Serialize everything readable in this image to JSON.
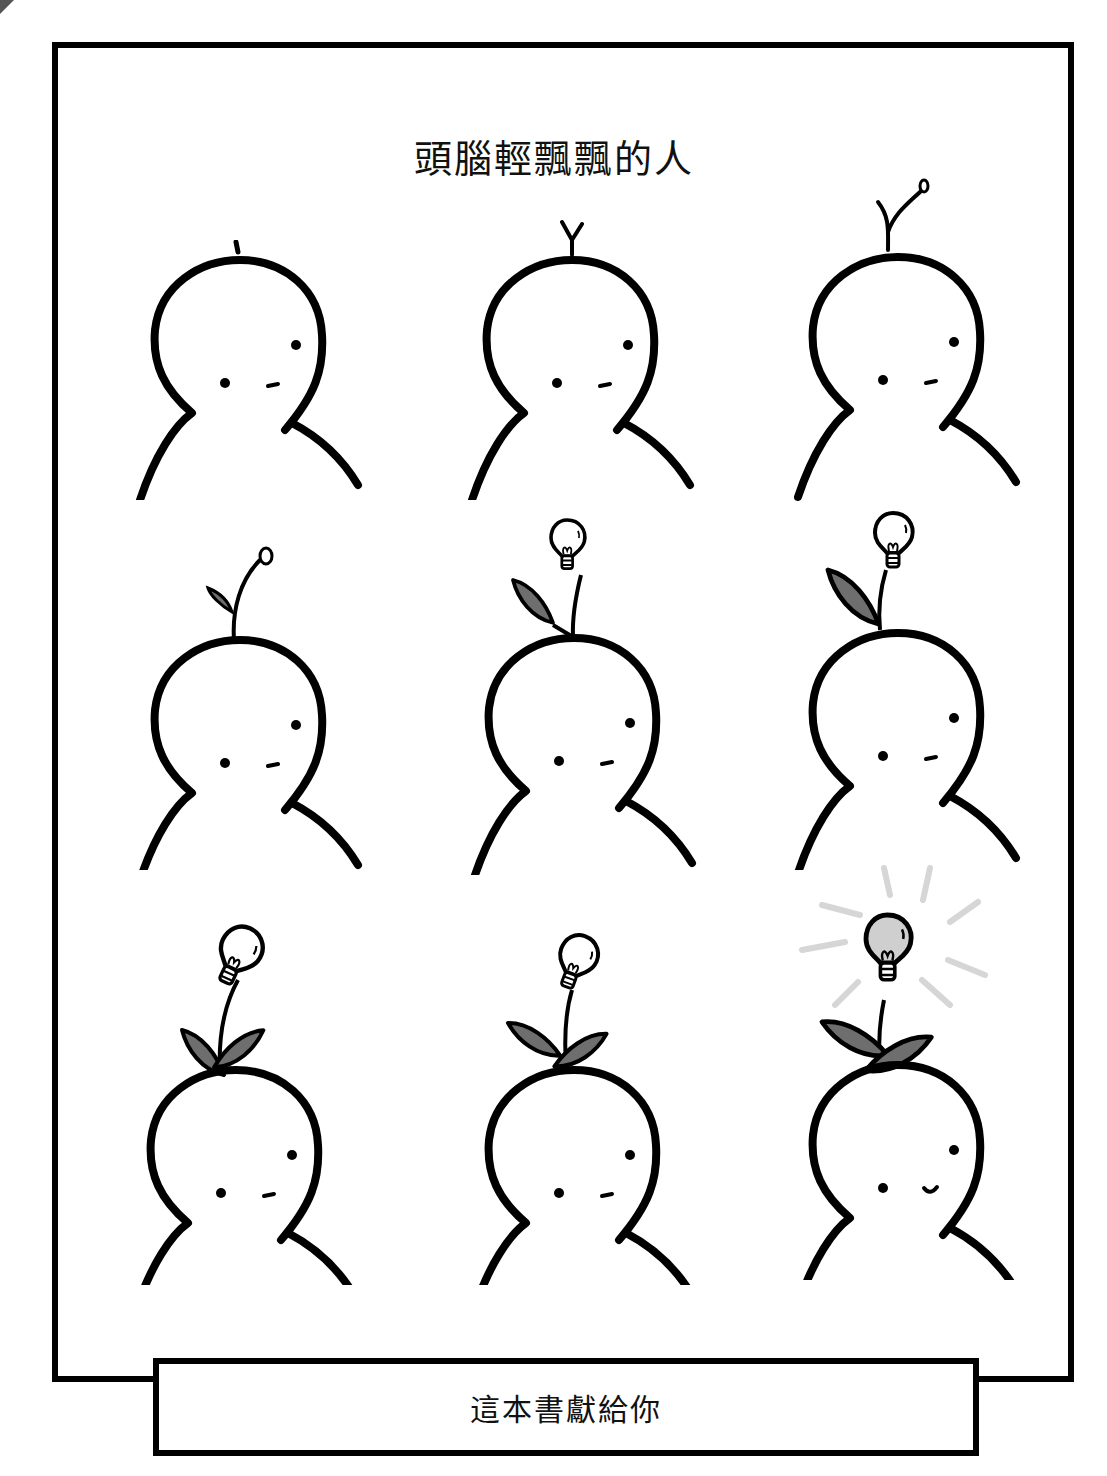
{
  "page": {
    "title": "頭腦輕飄飄的人",
    "dedication": "這本書獻給你"
  },
  "colors": {
    "ink": "#000000",
    "leaf_fill": "#6e6e6e",
    "bulb_lit_fill": "#cfcfcf",
    "rays": "#d6d6d6",
    "background": "#ffffff"
  },
  "figures": [
    {
      "row": 1,
      "col": 1,
      "stage": "nub",
      "expression": "neutral"
    },
    {
      "row": 1,
      "col": 2,
      "stage": "sprout-fork",
      "expression": "neutral"
    },
    {
      "row": 1,
      "col": 3,
      "stage": "sprout-bud",
      "expression": "neutral"
    },
    {
      "row": 2,
      "col": 1,
      "stage": "sprout-leaf-bud",
      "expression": "neutral"
    },
    {
      "row": 2,
      "col": 2,
      "stage": "small-bulb-one-leaf",
      "expression": "neutral"
    },
    {
      "row": 2,
      "col": 3,
      "stage": "bulb-one-large-leaf",
      "expression": "neutral"
    },
    {
      "row": 3,
      "col": 1,
      "stage": "bulb-two-leaves",
      "expression": "neutral"
    },
    {
      "row": 3,
      "col": 2,
      "stage": "bulb-two-leaves",
      "expression": "neutral"
    },
    {
      "row": 3,
      "col": 3,
      "stage": "lit-bulb-two-leaves",
      "expression": "smile"
    }
  ]
}
